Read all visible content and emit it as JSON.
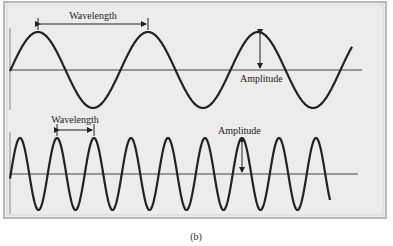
{
  "figure": {
    "caption": "(b)",
    "colors": {
      "panel_bg": "#ececec",
      "panel_border": "#b8b8b8",
      "wave": "#222222",
      "axis": "#444444"
    },
    "top_wave": {
      "label_wavelength": "Wavelength",
      "label_amplitude": "Amplitude",
      "axis_y": 70,
      "amplitude_px": 38,
      "wavelength_px": 110
    },
    "bottom_wave": {
      "label_wavelength": "Wavelength",
      "label_amplitude": "Amplitude",
      "axis_y": 174,
      "amplitude_px": 36,
      "wavelength_px": 37
    }
  }
}
